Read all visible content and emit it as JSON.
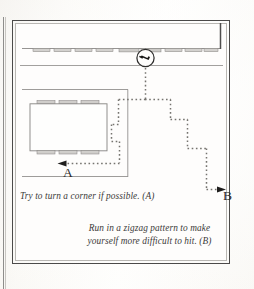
{
  "page": {
    "kind": "scanned-book-figure",
    "background_color": "#fdfcfa",
    "frame_color": "#4b4a49"
  },
  "figure": {
    "title": "",
    "line_color": "#8a8886",
    "dashed_path_color": "#7d7b79",
    "threat_icon": "gun-in-circle-icon",
    "labels": {
      "point_a": "A",
      "point_b": "B"
    },
    "captions": {
      "a": "Try to turn a corner if possible. (A)",
      "b": "Run in a zigzag pattern to make yourself more difficult to hit. (B)"
    },
    "elements": {
      "hallway_label": "corridor",
      "room_label": "room with table and chairs",
      "table_label": "conference table",
      "chairs_top_count": 3,
      "chairs_bottom_count": 3,
      "corridor_benches_count": 10
    }
  }
}
